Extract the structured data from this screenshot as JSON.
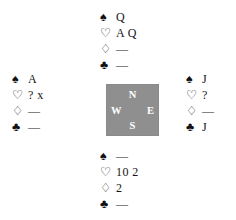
{
  "diagram": {
    "kind": "bridge-hand-diagram",
    "background_color": "#ffffff",
    "ink_color": "#111111"
  },
  "suits": {
    "spade": {
      "name": "spade-suit-symbol",
      "glyph": "♠"
    },
    "heart": {
      "name": "heart-suit-symbol",
      "glyph": "♡"
    },
    "diamond": {
      "name": "diamond-suit-symbol",
      "glyph": "♢"
    },
    "club": {
      "name": "club-suit-symbol",
      "glyph": "♣"
    }
  },
  "compass": {
    "name": "compass-box",
    "background_color": "#8f8f8f",
    "text_color": "#ffffff",
    "north": "N",
    "west": "W",
    "east": "E",
    "south": "S"
  },
  "hands": {
    "north": {
      "position": "North",
      "spades": "Q",
      "hearts": "A Q",
      "diamonds": "—",
      "clubs": "—"
    },
    "west": {
      "position": "West",
      "spades": "A",
      "hearts": "? x",
      "diamonds": "—",
      "clubs": "—"
    },
    "east": {
      "position": "East",
      "spades": "J",
      "hearts": "?",
      "diamonds": "—",
      "clubs": "J"
    },
    "south": {
      "position": "South",
      "spades": "—",
      "hearts": "10 2",
      "diamonds": "2",
      "clubs": "—"
    }
  }
}
